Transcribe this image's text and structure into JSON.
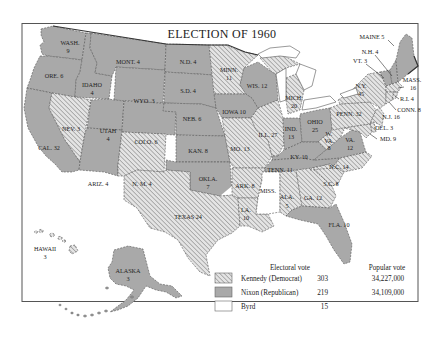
{
  "title": "ELECTION OF 1960",
  "colors": {
    "republican_fill": "#a9a9a9",
    "democrat_hatch_bg": "#e6e6e6",
    "democrat_hatch_line": "#8a8a8a",
    "byrd_fill": "#ffffff",
    "border": "#555555"
  },
  "states": [
    {
      "abbr": "WASH.",
      "votes": "9",
      "winner": "Nixon"
    },
    {
      "abbr": "ORE.",
      "votes": "6",
      "winner": "Nixon"
    },
    {
      "abbr": "CAL.",
      "votes": "32",
      "winner": "Nixon"
    },
    {
      "abbr": "IDAHO",
      "votes": "4",
      "winner": "Nixon"
    },
    {
      "abbr": "NEV.",
      "votes": "3",
      "winner": "Kennedy"
    },
    {
      "abbr": "MONT.",
      "votes": "4",
      "winner": "Nixon"
    },
    {
      "abbr": "WYO.",
      "votes": "3",
      "winner": "Nixon"
    },
    {
      "abbr": "UTAH",
      "votes": "4",
      "winner": "Nixon"
    },
    {
      "abbr": "ARIZ.",
      "votes": "4",
      "winner": "Nixon"
    },
    {
      "abbr": "COLO.",
      "votes": "6",
      "winner": "Nixon"
    },
    {
      "abbr": "N. M.",
      "votes": "4",
      "winner": "Kennedy"
    },
    {
      "abbr": "N.D.",
      "votes": "4",
      "winner": "Nixon"
    },
    {
      "abbr": "S.D.",
      "votes": "4",
      "winner": "Nixon"
    },
    {
      "abbr": "NEB.",
      "votes": "6",
      "winner": "Nixon"
    },
    {
      "abbr": "KAN.",
      "votes": "8",
      "winner": "Nixon"
    },
    {
      "abbr": "OKLA.",
      "votes": "7",
      "winner": "Nixon"
    },
    {
      "abbr": "TEXAS",
      "votes": "24",
      "winner": "Kennedy"
    },
    {
      "abbr": "MINN.",
      "votes": "11",
      "winner": "Kennedy"
    },
    {
      "abbr": "IOWA",
      "votes": "10",
      "winner": "Nixon"
    },
    {
      "abbr": "MO.",
      "votes": "13",
      "winner": "Kennedy"
    },
    {
      "abbr": "ARK.",
      "votes": "8",
      "winner": "Kennedy"
    },
    {
      "abbr": "LA.",
      "votes": "10",
      "winner": "Kennedy"
    },
    {
      "abbr": "WIS.",
      "votes": "12",
      "winner": "Nixon"
    },
    {
      "abbr": "ILL.",
      "votes": "27",
      "winner": "Kennedy"
    },
    {
      "abbr": "MICH.",
      "votes": "20",
      "winner": "Kennedy"
    },
    {
      "abbr": "IND.",
      "votes": "13",
      "winner": "Nixon"
    },
    {
      "abbr": "OHIO",
      "votes": "25",
      "winner": "Nixon"
    },
    {
      "abbr": "KY.",
      "votes": "10",
      "winner": "Nixon"
    },
    {
      "abbr": "TENN.",
      "votes": "11",
      "winner": "Nixon"
    },
    {
      "abbr": "MISS.",
      "votes": "",
      "winner": "Byrd"
    },
    {
      "abbr": "ALA.",
      "votes": "5",
      "winner": "Kennedy"
    },
    {
      "abbr": "GA.",
      "votes": "12",
      "winner": "Kennedy"
    },
    {
      "abbr": "FLA.",
      "votes": "10",
      "winner": "Nixon"
    },
    {
      "abbr": "S.C.",
      "votes": "8",
      "winner": "Kennedy"
    },
    {
      "abbr": "N.C.",
      "votes": "14",
      "winner": "Kennedy"
    },
    {
      "abbr": "VA.",
      "votes": "12",
      "winner": "Nixon"
    },
    {
      "abbr": "W. VA.",
      "votes": "8",
      "winner": "Kennedy"
    },
    {
      "abbr": "PENN.",
      "votes": "32",
      "winner": "Kennedy"
    },
    {
      "abbr": "N.Y.",
      "votes": "45",
      "winner": "Kennedy"
    },
    {
      "abbr": "MAINE",
      "votes": "5",
      "winner": "Nixon"
    },
    {
      "abbr": "N.H.",
      "votes": "4",
      "winner": "Nixon"
    },
    {
      "abbr": "VT.",
      "votes": "3",
      "winner": "Nixon"
    },
    {
      "abbr": "MASS.",
      "votes": "16",
      "winner": "Kennedy"
    },
    {
      "abbr": "R.I.",
      "votes": "4",
      "winner": "Kennedy"
    },
    {
      "abbr": "CONN.",
      "votes": "8",
      "winner": "Kennedy"
    },
    {
      "abbr": "N.J.",
      "votes": "16",
      "winner": "Kennedy"
    },
    {
      "abbr": "DEL.",
      "votes": "3",
      "winner": "Kennedy"
    },
    {
      "abbr": "MD.",
      "votes": "9",
      "winner": "Kennedy"
    },
    {
      "abbr": "HAWAII",
      "votes": "3",
      "winner": "Kennedy"
    },
    {
      "abbr": "ALASKA",
      "votes": "3",
      "winner": "Nixon"
    }
  ],
  "labels": {
    "wash": "WASH.",
    "wash_v": "9",
    "ore": "ORE. 6",
    "cal": "CAL. 32",
    "idaho": "IDAHO",
    "idaho_v": "4",
    "nev": "NEV. 3",
    "mont": "MONT. 4",
    "wyo": "WYO. 3",
    "utah": "UTAH",
    "utah_v": "4",
    "ariz": "ARIZ. 4",
    "colo": "COLO. 6",
    "nm": "N. M. 4",
    "nd": "N.D. 4",
    "sd": "S.D. 4",
    "neb": "NEB. 6",
    "kan": "KAN. 8",
    "okla": "OKLA.",
    "okla_v": "7",
    "texas": "TEXAS 24",
    "minn": "MINN.",
    "minn_v": "11",
    "iowa": "IOWA 10",
    "mo": "MO. 13",
    "ark": "ARK. 8",
    "la": "LA.",
    "la_v": "10",
    "wis": "WIS. 12",
    "ill": "ILL. 27",
    "mich": "MICH.",
    "mich_v": "20",
    "ind": "IND.",
    "ind_v": "13",
    "ohio": "OHIO",
    "ohio_v": "25",
    "ky": "KY. 10",
    "tenn": "TENN. 11",
    "miss": "MISS.",
    "ala": "ALA.",
    "ala_v": "5",
    "ga": "GA. 12",
    "fla": "FLA. 10",
    "sc": "S.C. 8",
    "nc": "N.C. 14",
    "va": "VA.",
    "va_v": "12",
    "wva1": "W.",
    "wva2": "VA.",
    "wva_v": "8",
    "penn": "PENN. 32",
    "ny": "N.Y.",
    "ny_v": "45",
    "maine": "MAINE 5",
    "nh": "N.H. 4",
    "vt": "VT. 3",
    "mass": "MASS.",
    "mass_v": "16",
    "ri": "R.I. 4",
    "conn": "CONN. 8",
    "nj": "N.J. 16",
    "del": "DEL. 3",
    "md": "MD. 9",
    "hawaii": "HAWAII",
    "hawaii_v": "3",
    "alaska": "ALASKA",
    "alaska_v": "3"
  },
  "legend": {
    "col_electoral": "Electoral vote",
    "col_popular": "Popular vote",
    "rows": [
      {
        "candidate": "Kennedy (Democrat)",
        "electoral": "303",
        "popular": "34,227,000",
        "swatch": "hatched"
      },
      {
        "candidate": "Nixon (Republican)",
        "electoral": "219",
        "popular": "34,109,000",
        "swatch": "gray"
      },
      {
        "candidate": "Byrd",
        "electoral": "15",
        "popular": "",
        "swatch": "white"
      }
    ]
  }
}
